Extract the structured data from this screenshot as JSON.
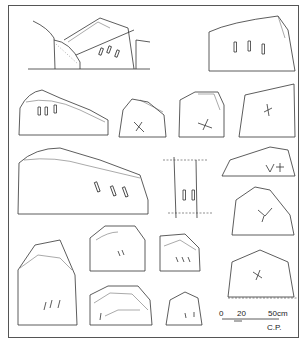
{
  "figure": {
    "stone_count": 17,
    "scale_bar": {
      "ticks": [
        "0",
        "20",
        "50cm"
      ],
      "credit": "C.P."
    }
  }
}
